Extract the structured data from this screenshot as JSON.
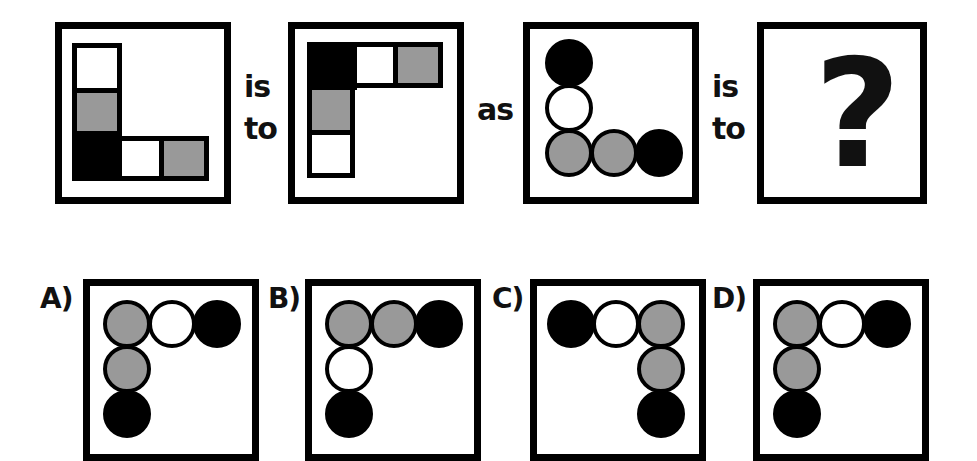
{
  "colors": {
    "black": "#000000",
    "gray": "#999999",
    "white": "#ffffff"
  },
  "question": {
    "connector_1": "is",
    "connector_1b": "to",
    "connector_2": "as",
    "connector_3": "is",
    "connector_3b": "to",
    "unknown": "?",
    "panel_1": {
      "shape": "square",
      "layout": "L (vertical left, horizontal bottom)",
      "vertical_top_to_bottom": [
        "white",
        "gray",
        "black"
      ],
      "horizontal_left_to_right": [
        "black",
        "white",
        "gray"
      ]
    },
    "panel_2": {
      "shape": "square",
      "layout": "Γ (horizontal top, vertical left)",
      "horizontal_left_to_right": [
        "black",
        "white",
        "gray"
      ],
      "vertical_top_to_bottom": [
        "black",
        "gray",
        "white"
      ]
    },
    "panel_3": {
      "shape": "circle",
      "layout": "L (vertical left, horizontal bottom)",
      "vertical_top_to_bottom": [
        "black",
        "white",
        "gray"
      ],
      "horizontal_left_to_right": [
        "gray",
        "gray",
        "black"
      ]
    }
  },
  "options": [
    {
      "label": "A)",
      "top_row": [
        "gray",
        "white",
        "black"
      ],
      "column_side": "left",
      "column_top_to_bottom": [
        "gray",
        "gray",
        "black"
      ]
    },
    {
      "label": "B)",
      "top_row": [
        "gray",
        "gray",
        "black"
      ],
      "column_side": "left",
      "column_top_to_bottom": [
        "gray",
        "white",
        "black"
      ]
    },
    {
      "label": "C)",
      "top_row": [
        "black",
        "white",
        "gray"
      ],
      "column_side": "right",
      "column_top_to_bottom": [
        "gray",
        "gray",
        "black"
      ]
    },
    {
      "label": "D)",
      "top_row": [
        "gray",
        "white",
        "black"
      ],
      "column_side": "left",
      "column_top_to_bottom": [
        "gray",
        "gray",
        "black"
      ]
    }
  ]
}
